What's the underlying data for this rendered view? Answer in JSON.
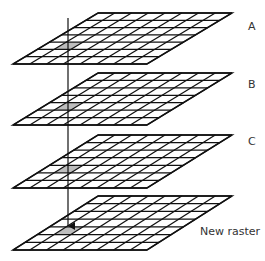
{
  "diagram": {
    "grid": {
      "columns": 8,
      "rows": 7
    },
    "highlight_cell": {
      "row": 4,
      "col": 1,
      "color": "#bdbdbd"
    },
    "layers": [
      {
        "id": "A",
        "label": "A",
        "top_y": 13,
        "bottom_y": 64,
        "label_x": 248,
        "label_y": 30
      },
      {
        "id": "B",
        "label": "B",
        "top_y": 73,
        "bottom_y": 125,
        "label_x": 248,
        "label_y": 88
      },
      {
        "id": "C",
        "label": "C",
        "top_y": 135,
        "bottom_y": 188,
        "label_x": 248,
        "label_y": 145
      },
      {
        "id": "D",
        "label": "New raster",
        "top_y": 196,
        "bottom_y": 250,
        "label_x": 200,
        "label_y": 235
      }
    ],
    "arrow": {
      "x": 68,
      "y_start": 18,
      "y_end": 226
    },
    "colors": {
      "line": "#111111",
      "label": "#333333",
      "background": "#ffffff"
    }
  }
}
